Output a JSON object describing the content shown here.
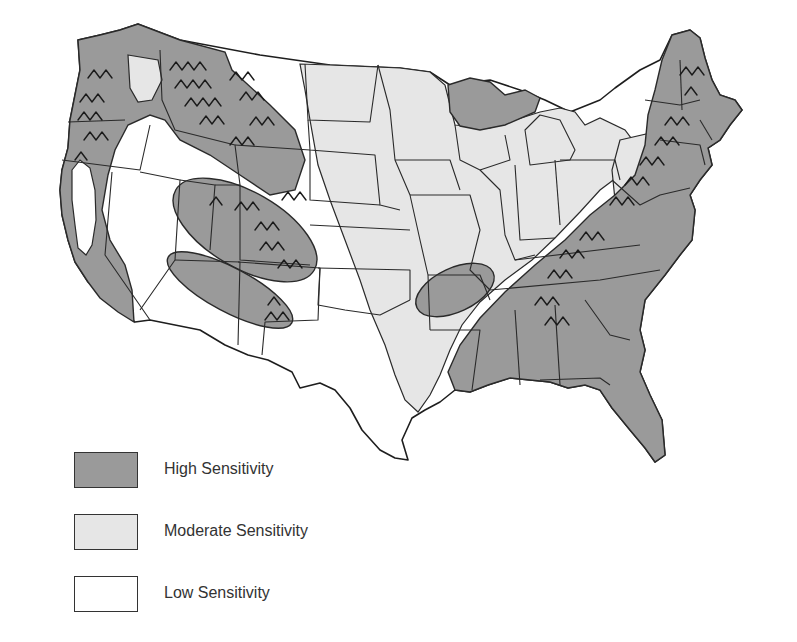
{
  "map": {
    "subject": "Contiguous United States sensitivity zones",
    "colors": {
      "high": "#9a9a9a",
      "moderate": "#e6e6e6",
      "low": "#ffffff",
      "border": "#2a2a2a"
    },
    "symbol_note": "Mountain (chevron) symbols overlay mountainous high-sensitivity areas"
  },
  "legend": {
    "items": [
      {
        "key": "high",
        "label": "High Sensitivity",
        "color": "#9a9a9a"
      },
      {
        "key": "moderate",
        "label": "Moderate Sensitivity",
        "color": "#e6e6e6"
      },
      {
        "key": "low",
        "label": "Low Sensitivity",
        "color": "#ffffff"
      }
    ]
  }
}
